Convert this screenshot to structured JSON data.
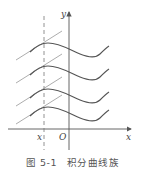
{
  "figure": {
    "caption_number": "图 5-1",
    "caption_title": "积分曲线族",
    "axis_x_label": "x",
    "axis_y_label": "y",
    "origin_label": "O",
    "point_label": "x",
    "curve_count": 4,
    "colors": {
      "curve": "#555555",
      "axis": "#555555",
      "tangent": "#888888",
      "dashed": "#777777"
    }
  }
}
